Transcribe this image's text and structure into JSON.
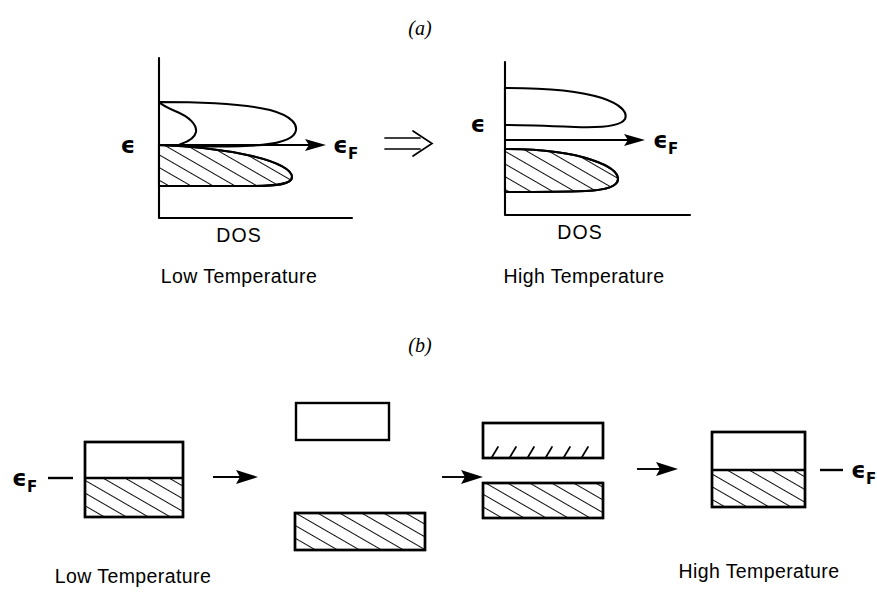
{
  "figure": {
    "panel_a_letter": "(a)",
    "panel_b_letter": "(b)",
    "axis_label_dos": "DOS",
    "epsilon_symbol": "ϵ",
    "epsilon_f_symbol": "ϵ",
    "epsilon_f_subscript": "F",
    "caption_low_temperature": "Low Temperature",
    "caption_high_temperature": "High Temperature",
    "colors": {
      "ink": "#000000",
      "background": "#ffffff"
    }
  },
  "panel_a": {
    "letter": "(a)",
    "left_plot": {
      "caption": "Low Temperature",
      "x_axis_label": "DOS",
      "energy_label": "ϵ",
      "fermi_label": "ϵ",
      "fermi_subscript": "F",
      "description": "Single connected density-of-states lobe; lower portion below the Fermi level is hatched (occupied), upper portion empty, joined by a narrow waist at the Fermi energy"
    },
    "transition_arrow": "⇒",
    "right_plot": {
      "caption": "High Temperature",
      "x_axis_label": "DOS",
      "energy_label": "ϵ",
      "fermi_label": "ϵ",
      "fermi_subscript": "F",
      "description": "Density of states splits into two separated lobes with a gap at the Fermi level; lower lobe hatched (occupied), upper lobe empty"
    }
  },
  "panel_b": {
    "letter": "(b)",
    "fermi_label_left": "ϵ",
    "fermi_left_subscript": "F",
    "fermi_label_right": "ϵ",
    "fermi_right_subscript": "F",
    "caption_left": "Low Temperature",
    "caption_right": "High Temperature",
    "stages": [
      {
        "name": "stage-1-single-band",
        "description": "Single rectangular band, lower part hatched (filled) up to the Fermi level, upper part empty"
      },
      {
        "name": "stage-2-split-bands",
        "description": "Band split into an upper empty rectangle and a lower fully hatched rectangle, widely separated"
      },
      {
        "name": "stage-3-partial-transfer",
        "description": "Upper empty rectangle with short hatch ticks along its lower edge, lower fully hatched rectangle, gap narrowed"
      },
      {
        "name": "stage-4-merged-band",
        "description": "Bands merged back into one rectangle with hatched lower portion up to the Fermi level"
      }
    ],
    "arrows": [
      "→",
      "→",
      "→"
    ]
  }
}
